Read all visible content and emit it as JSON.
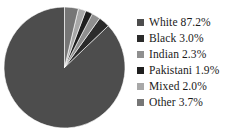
{
  "background_color": "#ffffff",
  "chart_data": {
    "type": "pie",
    "title": "",
    "subtitle": "",
    "xlabel": "",
    "ylabel": "",
    "legend_position": "right",
    "grid": false,
    "value_unit": "percent",
    "start_angle_deg": 0,
    "direction": "counterclockwise",
    "categories": [
      "White",
      "Black",
      "Indian",
      "Pakistani",
      "Mixed",
      "Other"
    ],
    "values": [
      87.2,
      3.0,
      2.3,
      1.9,
      2.0,
      3.7
    ],
    "value_labels": [
      "87.2%",
      "3.0%",
      "2.3%",
      "1.9%",
      "2.0%",
      "3.7%"
    ],
    "colors": [
      "#4d4d4d",
      "#2b2b2b",
      "#8f8f8f",
      "#1f1f1f",
      "#a8a8a8",
      "#767676"
    ],
    "slices": [
      {
        "label": "White",
        "value": 87.2,
        "value_label": "87.2%",
        "color": "#4d4d4d"
      },
      {
        "label": "Black",
        "value": 3.0,
        "value_label": "3.0%",
        "color": "#2b2b2b"
      },
      {
        "label": "Indian",
        "value": 2.3,
        "value_label": "2.3%",
        "color": "#8f8f8f"
      },
      {
        "label": "Pakistani",
        "value": 1.9,
        "value_label": "1.9%",
        "color": "#1f1f1f"
      },
      {
        "label": "Mixed",
        "value": 2.0,
        "value_label": "2.0%",
        "color": "#a8a8a8"
      },
      {
        "label": "Other",
        "value": 3.7,
        "value_label": "3.7%",
        "color": "#767676"
      }
    ]
  },
  "legend": {
    "items": [
      {
        "text": "White 87.2%",
        "color": "#4d4d4d"
      },
      {
        "text": "Black 3.0%",
        "color": "#2b2b2b"
      },
      {
        "text": "Indian 2.3%",
        "color": "#8f8f8f"
      },
      {
        "text": "Pakistani 1.9%",
        "color": "#1f1f1f"
      },
      {
        "text": "Mixed 2.0%",
        "color": "#a8a8a8"
      },
      {
        "text": "Other 3.7%",
        "color": "#767676"
      }
    ]
  }
}
